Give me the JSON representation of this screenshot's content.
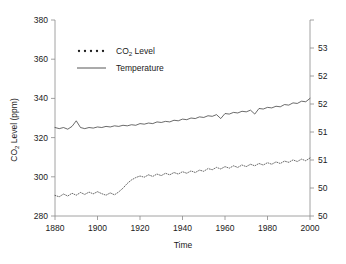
{
  "chart_data": {
    "type": "line",
    "title": "",
    "xlabel": "Time",
    "ylabel": "CO 2  Level (ppm)",
    "ylabel_main": "CO",
    "ylabel_sub": "2",
    "ylabel_rest": " Level (ppm)",
    "xlim": [
      1880,
      2000
    ],
    "ylim": [
      280,
      380
    ],
    "y2lim": [
      49.5,
      53.0
    ],
    "y2label": "",
    "grid": false,
    "legend_position": "upper-left-inside",
    "xticks": [
      1880,
      1900,
      1920,
      1940,
      1960,
      1980,
      2000
    ],
    "xtick_labels": [
      "1880",
      "1900",
      "1920",
      "1940",
      "1960",
      "1980",
      "2000"
    ],
    "yticks": [
      280,
      300,
      320,
      340,
      360,
      380
    ],
    "ytick_labels": [
      "280",
      "300",
      "320",
      "340",
      "360",
      "380"
    ],
    "y2ticks": [
      49.5,
      50.0,
      50.5,
      51.0,
      51.5,
      52.0,
      52.5,
      53.0
    ],
    "y2tick_labels": [
      "50",
      "50",
      "51",
      "51",
      "52",
      "52",
      "53"
    ],
    "series": [
      {
        "name": "CO",
        "name_sub": "2",
        "name_rest": " Level",
        "label": "CO 2  Level",
        "style": "dotted",
        "axis": "left",
        "units": "ppm",
        "x": [
          1880,
          1882,
          1884,
          1886,
          1888,
          1890,
          1892,
          1894,
          1896,
          1898,
          1900,
          1902,
          1904,
          1906,
          1908,
          1910,
          1912,
          1914,
          1916,
          1918,
          1920,
          1922,
          1924,
          1926,
          1928,
          1930,
          1932,
          1934,
          1936,
          1938,
          1940,
          1942,
          1944,
          1946,
          1948,
          1950,
          1952,
          1954,
          1956,
          1958,
          1960,
          1962,
          1964,
          1966,
          1968,
          1970,
          1972,
          1974,
          1976,
          1978,
          1980,
          1982,
          1984,
          1986,
          1988,
          1990,
          1992,
          1994,
          1996,
          1998,
          2000
        ],
        "values": [
          290.5,
          289.8,
          291.2,
          290.2,
          291.6,
          290.6,
          292.0,
          291.0,
          292.2,
          291.3,
          292.4,
          291.4,
          290.6,
          291.8,
          290.8,
          292.3,
          294.2,
          296.6,
          298.4,
          299.6,
          300.4,
          299.8,
          301.0,
          300.2,
          301.4,
          300.6,
          301.8,
          301.0,
          302.2,
          301.4,
          302.6,
          301.8,
          303.0,
          302.2,
          303.4,
          302.8,
          304.2,
          303.6,
          304.8,
          304.0,
          305.2,
          304.4,
          305.6,
          304.8,
          306.0,
          305.2,
          306.4,
          305.6,
          306.8,
          306.0,
          307.2,
          306.4,
          307.6,
          306.8,
          308.0,
          307.4,
          308.6,
          307.8,
          309.0,
          308.2,
          309.6
        ]
      },
      {
        "name": "Temperature",
        "label": "Temperature",
        "style": "solid",
        "axis": "right",
        "units": "degrees",
        "x": [
          1880,
          1882,
          1884,
          1886,
          1888,
          1890,
          1892,
          1894,
          1896,
          1898,
          1900,
          1902,
          1904,
          1906,
          1908,
          1910,
          1912,
          1914,
          1916,
          1918,
          1920,
          1922,
          1924,
          1926,
          1928,
          1930,
          1932,
          1934,
          1936,
          1938,
          1940,
          1942,
          1944,
          1946,
          1948,
          1950,
          1952,
          1954,
          1956,
          1958,
          1960,
          1962,
          1964,
          1966,
          1968,
          1970,
          1972,
          1974,
          1976,
          1978,
          1980,
          1982,
          1984,
          1986,
          1988,
          1990,
          1992,
          1994,
          1996,
          1998,
          2000
        ],
        "values": [
          51.08,
          51.06,
          51.08,
          51.05,
          51.1,
          51.2,
          51.08,
          51.06,
          51.08,
          51.07,
          51.09,
          51.08,
          51.1,
          51.09,
          51.11,
          51.1,
          51.12,
          51.11,
          51.13,
          51.12,
          51.15,
          51.14,
          51.16,
          51.15,
          51.18,
          51.17,
          51.19,
          51.18,
          51.21,
          51.2,
          51.23,
          51.22,
          51.25,
          51.24,
          51.27,
          51.26,
          51.29,
          51.28,
          51.31,
          51.24,
          51.33,
          51.32,
          51.35,
          51.34,
          51.37,
          51.36,
          51.39,
          51.32,
          51.42,
          51.41,
          51.44,
          51.43,
          51.46,
          51.45,
          51.49,
          51.48,
          51.52,
          51.51,
          51.55,
          51.54,
          51.6
        ]
      }
    ]
  }
}
